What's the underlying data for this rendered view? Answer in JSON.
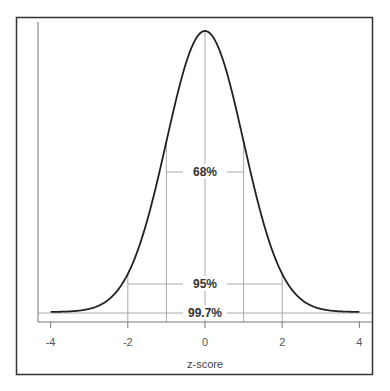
{
  "chart_data": {
    "type": "line",
    "title": "",
    "xlabel": "z-score",
    "ylabel": "",
    "xlim": [
      -4,
      4
    ],
    "x_ticks": [
      -4,
      -2,
      0,
      2,
      4
    ],
    "x_tick_labels": [
      "-4",
      "-2",
      "0",
      "2",
      "4"
    ],
    "grid": false,
    "legend": null,
    "series": [
      {
        "name": "standard normal density",
        "function": "exp(-z^2/2)/sqrt(2*pi)",
        "x_range": [
          -4,
          4
        ]
      }
    ],
    "annotations": [
      {
        "label": "68%",
        "range": [
          -1,
          1
        ]
      },
      {
        "label": "95%",
        "range": [
          -2,
          2
        ]
      },
      {
        "label": "99.7%",
        "range": [
          -3,
          3
        ]
      }
    ]
  },
  "colors": {
    "curve": "#222222",
    "guide": "#aaaaaa",
    "frame": "#333333",
    "text": "#333333"
  }
}
